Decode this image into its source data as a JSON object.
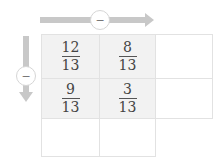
{
  "top_arrow": {
    "direction": "right",
    "operator": "−",
    "color": "#c8c8c8"
  },
  "left_arrow": {
    "direction": "down",
    "operator": "−",
    "color": "#c8c8c8"
  },
  "grid": {
    "rows": [
      [
        {
          "numerator": "12",
          "denominator": "13",
          "filled": true
        },
        {
          "numerator": "8",
          "denominator": "13",
          "filled": true
        },
        {
          "numerator": "",
          "denominator": "",
          "filled": false
        }
      ],
      [
        {
          "numerator": "9",
          "denominator": "13",
          "filled": true
        },
        {
          "numerator": "3",
          "denominator": "13",
          "filled": true
        },
        {
          "numerator": "",
          "denominator": "",
          "filled": false
        }
      ],
      [
        {
          "numerator": "",
          "denominator": "",
          "filled": false
        },
        {
          "numerator": "",
          "denominator": "",
          "filled": false
        },
        {
          "numerator": "",
          "denominator": "",
          "filled": false
        }
      ]
    ]
  }
}
